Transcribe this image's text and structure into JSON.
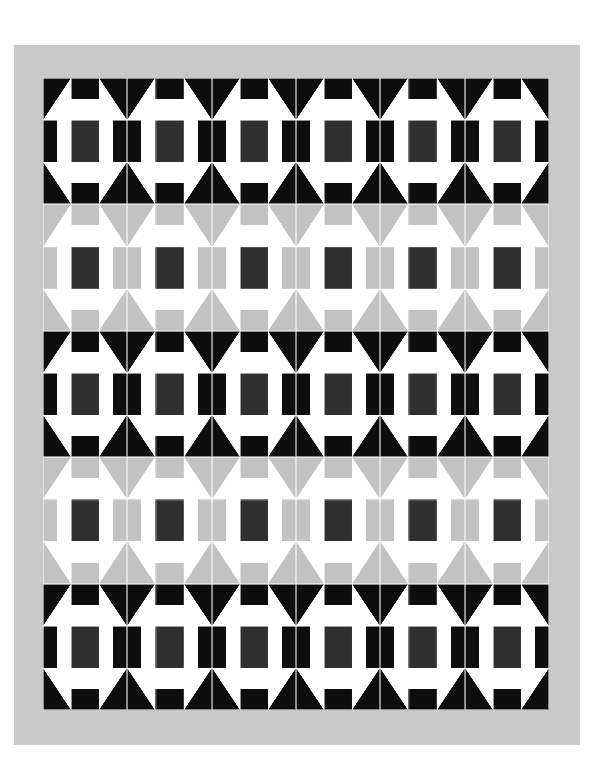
{
  "artwork": {
    "title": "Patchwork Quilt Layout",
    "kind": "quilt-diagram",
    "canvas": {
      "width": 591,
      "height": 780,
      "background": "#ffffff"
    }
  },
  "palette": {
    "background": "#ffffff",
    "border_gray": "#c9c9c9",
    "block_black": "#0d0d0d",
    "block_gray": "#c2c2c2",
    "center_dark": "#303030",
    "white": "#ffffff",
    "seam_line": "#ffffff"
  },
  "border": {
    "label": "outer border",
    "color": "#c9c9c9",
    "x": 14,
    "y": 45,
    "width": 566,
    "height": 700,
    "inset": 29
  },
  "field": {
    "label": "quilt center",
    "x": 43,
    "y": 78,
    "width": 506,
    "height": 632,
    "columns": 6,
    "rows": 5,
    "block_width": 84.33,
    "block_height": 126.4
  },
  "block_template": {
    "name": "shoo-fly-star",
    "grid": "3x3",
    "cells": [
      {
        "pos": "top-left",
        "type": "half-square-triangle",
        "orientation": "tl"
      },
      {
        "pos": "top-center",
        "type": "bar",
        "orientation": "top"
      },
      {
        "pos": "top-right",
        "type": "half-square-triangle",
        "orientation": "tr"
      },
      {
        "pos": "mid-left",
        "type": "bar",
        "orientation": "left"
      },
      {
        "pos": "center",
        "type": "solid",
        "orientation": "center"
      },
      {
        "pos": "mid-right",
        "type": "bar",
        "orientation": "right"
      },
      {
        "pos": "bottom-left",
        "type": "half-square-triangle",
        "orientation": "bl"
      },
      {
        "pos": "bottom-center",
        "type": "bar",
        "orientation": "bottom"
      },
      {
        "pos": "bottom-right",
        "type": "half-square-triangle",
        "orientation": "br"
      }
    ]
  },
  "rows": [
    {
      "index": 0,
      "variant": "black",
      "dark": "#0d0d0d",
      "center": "#303030",
      "blocks": 6
    },
    {
      "index": 1,
      "variant": "gray",
      "dark": "#c2c2c2",
      "center": "#303030",
      "blocks": 6
    },
    {
      "index": 2,
      "variant": "black",
      "dark": "#0d0d0d",
      "center": "#303030",
      "blocks": 6
    },
    {
      "index": 3,
      "variant": "gray",
      "dark": "#c2c2c2",
      "center": "#303030",
      "blocks": 6
    },
    {
      "index": 4,
      "variant": "black",
      "dark": "#0d0d0d",
      "center": "#303030",
      "blocks": 6
    }
  ]
}
